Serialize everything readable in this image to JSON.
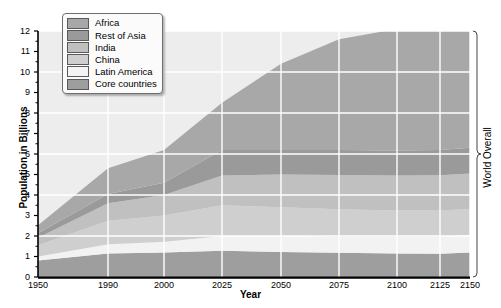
{
  "chart_data": {
    "type": "area",
    "title": "",
    "xlabel": "Year",
    "ylabel": "Population in Billions",
    "right_axis_label": "World Overall",
    "stacked": true,
    "grid": true,
    "legend_position": "top-left",
    "ylim": [
      0,
      12
    ],
    "ytick_labels": [
      "0",
      "1",
      "2",
      "3",
      "4",
      "5",
      "6",
      "7",
      "8",
      "9",
      "10",
      "11",
      "12"
    ],
    "ytick_values": [
      0,
      1,
      2,
      3,
      4,
      5,
      6,
      7,
      8,
      9,
      10,
      11,
      12
    ],
    "xtick_labels": [
      "1950",
      "1990",
      "2000",
      "2025",
      "2050",
      "2075",
      "2100",
      "2125",
      "2150"
    ],
    "xtick_values": [
      1950,
      1990,
      2000,
      2025,
      2050,
      2075,
      2100,
      2125,
      2150
    ],
    "x_axis_note": "non-linear spacing of year ticks",
    "x": [
      1950,
      1990,
      2000,
      2025,
      2050,
      2075,
      2100,
      2125,
      2150
    ],
    "series": [
      {
        "name": "Core countries",
        "color": "#9e9e9e",
        "stack_order": 1,
        "values": [
          0.8,
          1.15,
          1.2,
          1.28,
          1.22,
          1.18,
          1.15,
          1.14,
          1.2
        ]
      },
      {
        "name": "Latin America",
        "color": "#f2f2f2",
        "stack_order": 2,
        "values": [
          0.2,
          0.45,
          0.52,
          0.72,
          0.78,
          0.8,
          0.82,
          0.84,
          0.86
        ]
      },
      {
        "name": "China",
        "color": "#cfcfcf",
        "stack_order": 3,
        "values": [
          0.55,
          1.15,
          1.28,
          1.5,
          1.4,
          1.32,
          1.28,
          1.26,
          1.26
        ]
      },
      {
        "name": "India",
        "color": "#c0c0c0",
        "stack_order": 4,
        "values": [
          0.36,
          0.85,
          1.0,
          1.45,
          1.6,
          1.68,
          1.7,
          1.72,
          1.73
        ]
      },
      {
        "name": "Rest of Asia",
        "color": "#9a9a9a",
        "stack_order": 5,
        "values": [
          0.22,
          0.45,
          0.6,
          1.25,
          1.2,
          1.22,
          1.22,
          1.24,
          1.25
        ]
      },
      {
        "name": "Africa",
        "color": "#a8a8a8",
        "stack_order": 6,
        "values": [
          0.4,
          1.25,
          1.6,
          2.3,
          4.2,
          5.4,
          5.93,
          6.2,
          5.7
        ]
      }
    ],
    "cumulative_totals": [
      2.53,
      5.3,
      6.2,
      8.5,
      10.4,
      11.6,
      12.1,
      12.4,
      12.0
    ]
  },
  "legend": {
    "items": [
      {
        "label": "Africa",
        "color": "#a8a8a8"
      },
      {
        "label": "Rest of Asia",
        "color": "#9a9a9a"
      },
      {
        "label": "India",
        "color": "#c0c0c0"
      },
      {
        "label": "China",
        "color": "#cfcfcf"
      },
      {
        "label": "Latin America",
        "color": "#f4f4f4"
      },
      {
        "label": "Core countries",
        "color": "#9e9e9e"
      }
    ]
  },
  "axes": {
    "y_title": "Population in Billions",
    "x_title": "Year",
    "right_title": "World Overall"
  }
}
